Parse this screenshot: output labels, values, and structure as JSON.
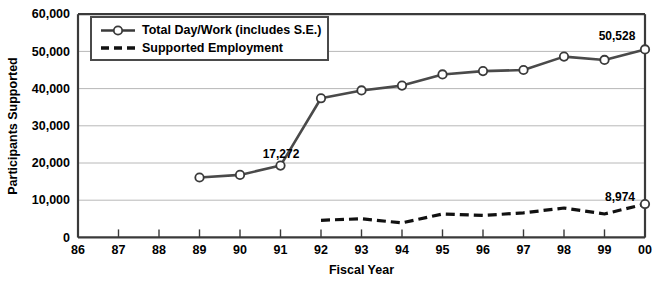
{
  "chart_data": {
    "type": "line",
    "title": "",
    "xlabel": "Fiscal Year",
    "ylabel": "Participants Supported",
    "categories": [
      "86",
      "87",
      "88",
      "89",
      "90",
      "91",
      "92",
      "93",
      "94",
      "95",
      "96",
      "97",
      "98",
      "99",
      "00"
    ],
    "xlim": [
      86,
      100
    ],
    "ylim": [
      0,
      60000
    ],
    "ytick_labels": [
      "0",
      "10,000",
      "20,000",
      "30,000",
      "40,000",
      "50,000",
      "60,000"
    ],
    "ytick_values": [
      0,
      10000,
      20000,
      30000,
      40000,
      50000,
      60000
    ],
    "grid": true,
    "legend_position": "top-left",
    "series": [
      {
        "name": "Total Day/Work (includes S.E.)",
        "style": "solid-with-markers",
        "color": "#4a4a4a",
        "x": [
          "89",
          "90",
          "91",
          "92",
          "93",
          "94",
          "95",
          "96",
          "97",
          "98",
          "99",
          "00"
        ],
        "values": [
          16100,
          16800,
          19300,
          37400,
          39500,
          40800,
          43800,
          44700,
          45000,
          48600,
          47700,
          50528
        ]
      },
      {
        "name": "Supported Employment",
        "style": "dashed",
        "color": "#111111",
        "x": [
          "92",
          "93",
          "94",
          "95",
          "96",
          "97",
          "98",
          "99",
          "00"
        ],
        "values": [
          4600,
          5000,
          3900,
          6300,
          5900,
          6600,
          7900,
          6300,
          8974
        ]
      }
    ],
    "annotations": [
      {
        "text": "17,272",
        "series": "Total Day/Work (includes S.E.)",
        "x": "91",
        "value": 17272
      },
      {
        "text": "50,528",
        "series": "Total Day/Work (includes S.E.)",
        "x": "00",
        "value": 50528
      },
      {
        "text": "8,974",
        "series": "Supported Employment",
        "x": "00",
        "value": 8974
      }
    ]
  },
  "legend": {
    "items": [
      {
        "label": "Total Day/Work (includes S.E.)",
        "marker": "line-with-circle-marker"
      },
      {
        "label": "Supported Employment",
        "marker": "dashed-line"
      }
    ]
  },
  "axes": {
    "y_title": "Participants Supported",
    "x_title": "Fiscal Year"
  }
}
